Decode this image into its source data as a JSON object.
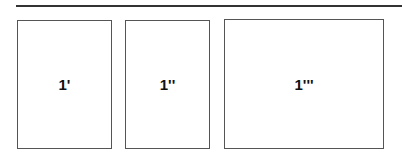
{
  "boxes": [
    {
      "label": "1'"
    },
    {
      "label": "1''"
    },
    {
      "label": "1'''"
    }
  ]
}
